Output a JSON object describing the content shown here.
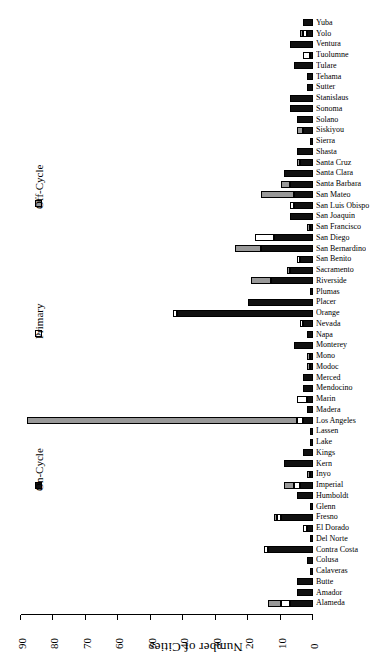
{
  "chart_data": {
    "type": "bar",
    "orientation": "horizontal-stacked",
    "title": "Number of Cities",
    "xlabel": "Number of Cities",
    "ylabel": "",
    "xlim": [
      0,
      90
    ],
    "xticks": [
      0,
      10,
      20,
      30,
      40,
      50,
      60,
      70,
      80,
      90
    ],
    "grid": false,
    "legend_position": "left",
    "rotated_180": true,
    "legend": [
      {
        "name": "On-Cycle",
        "color": "#111111"
      },
      {
        "name": "Primary",
        "color": "#ffffff"
      },
      {
        "name": "Off-Cycle",
        "color": "#999999"
      }
    ],
    "categories": [
      "Alameda",
      "Amador",
      "Butte",
      "Calaveras",
      "Colusa",
      "Contra Costa",
      "Del Norte",
      "El Dorado",
      "Fresno",
      "Glenn",
      "Humboldt",
      "Imperial",
      "Inyo",
      "Kern",
      "Kings",
      "Lake",
      "Lassen",
      "Los Angeles",
      "Madera",
      "Marin",
      "Mendocino",
      "Merced",
      "Modoc",
      "Mono",
      "Monterey",
      "Napa",
      "Nevada",
      "Orange",
      "Placer",
      "Plumas",
      "Riverside",
      "Sacramento",
      "San Benito",
      "San Bernardino",
      "San Diego",
      "San Francisco",
      "San Joaquin",
      "San Luis Obispo",
      "San Mateo",
      "Santa Barbara",
      "Santa Clara",
      "Santa Cruz",
      "Shasta",
      "Sierra",
      "Siskiyou",
      "Solano",
      "Sonoma",
      "Stanislaus",
      "Sutter",
      "Tehama",
      "Tulare",
      "Tuolumne",
      "Ventura",
      "Yolo",
      "Yuba"
    ],
    "series": [
      {
        "name": "On-Cycle",
        "color": "#111111",
        "values": [
          7,
          5,
          5,
          1,
          2,
          14,
          1,
          2,
          10,
          1,
          5,
          4,
          1,
          9,
          3,
          1,
          1,
          3,
          2,
          2,
          3,
          3,
          1,
          1,
          6,
          2,
          3,
          42,
          20,
          1,
          13,
          7,
          4,
          16,
          12,
          1,
          7,
          6,
          6,
          7,
          9,
          4,
          5,
          1,
          3,
          5,
          7,
          7,
          2,
          2,
          6,
          1,
          7,
          2,
          3
        ]
      },
      {
        "name": "Primary",
        "color": "#ffffff",
        "values": [
          3,
          0,
          0,
          0,
          0,
          1,
          0,
          1,
          1,
          0,
          0,
          2,
          0,
          0,
          0,
          0,
          0,
          2,
          0,
          3,
          0,
          0,
          0,
          0,
          0,
          0,
          1,
          1,
          0,
          0,
          0,
          0,
          1,
          0,
          6,
          0,
          0,
          1,
          0,
          0,
          0,
          0,
          0,
          0,
          0,
          0,
          0,
          0,
          0,
          0,
          0,
          2,
          0,
          1,
          0
        ]
      },
      {
        "name": "Off-Cycle",
        "color": "#999999",
        "values": [
          4,
          0,
          0,
          0,
          0,
          0,
          0,
          0,
          1,
          0,
          0,
          3,
          1,
          0,
          0,
          0,
          0,
          83,
          0,
          0,
          0,
          0,
          1,
          1,
          0,
          0,
          0,
          0,
          0,
          0,
          6,
          1,
          0,
          8,
          0,
          1,
          0,
          0,
          10,
          3,
          0,
          1,
          0,
          0,
          2,
          0,
          0,
          0,
          0,
          0,
          0,
          0,
          0,
          1,
          0
        ]
      }
    ]
  }
}
